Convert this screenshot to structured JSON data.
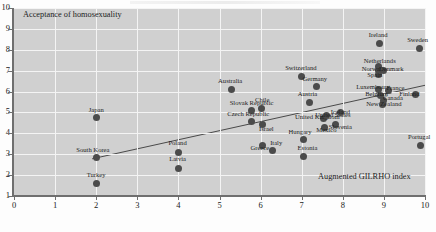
{
  "axes": {
    "y_title": "Acceptance of homosexuality",
    "x_title": "Augmented GILRHO index",
    "y_ticks": [
      "10",
      "9",
      "8",
      "7",
      "6",
      "5",
      "4",
      "3",
      "2",
      "1"
    ],
    "x_ticks": [
      "0",
      "1",
      "2",
      "3",
      "4",
      "5",
      "6",
      "7",
      "8",
      "9",
      "10"
    ]
  },
  "chart_data": {
    "type": "scatter",
    "title": "",
    "xlabel": "Augmented GILRHO index",
    "ylabel": "Acceptance of homosexuality",
    "xlim": [
      0,
      10
    ],
    "ylim": [
      1,
      10
    ],
    "grid": true,
    "legend": "none",
    "trendline": {
      "x": [
        1.9,
        10.0
      ],
      "y": [
        2.78,
        6.3
      ]
    },
    "points": [
      {
        "label": "Japan",
        "x": 2.0,
        "y": 4.75,
        "lx": 2.0,
        "ly": 5.12
      },
      {
        "label": "South Korea",
        "x": 2.0,
        "y": 2.82,
        "lx": 1.92,
        "ly": 3.22
      },
      {
        "label": "Turkey",
        "x": 2.0,
        "y": 1.58,
        "lx": 2.0,
        "ly": 2.0
      },
      {
        "label": "Poland",
        "x": 4.0,
        "y": 3.1,
        "lx": 3.98,
        "ly": 3.52
      },
      {
        "label": "Latvia",
        "x": 4.0,
        "y": 2.33,
        "lx": 3.98,
        "ly": 2.78
      },
      {
        "label": "Australia",
        "x": 5.28,
        "y": 6.1,
        "lx": 5.26,
        "ly": 6.5
      },
      {
        "label": "Slovak Republic",
        "x": 5.78,
        "y": 5.07,
        "lx": 5.78,
        "ly": 5.45
      },
      {
        "label": "Czech Republic",
        "x": 5.78,
        "y": 4.55,
        "lx": 5.7,
        "ly": 4.92
      },
      {
        "label": "Chile",
        "x": 6.02,
        "y": 5.18,
        "lx": 6.04,
        "ly": 5.58
      },
      {
        "label": "Israel",
        "x": 6.04,
        "y": 4.44,
        "lx": 6.14,
        "ly": 4.22
      },
      {
        "label": "Greece",
        "x": 6.04,
        "y": 3.42,
        "lx": 5.98,
        "ly": 3.3
      },
      {
        "label": "Italy",
        "x": 6.28,
        "y": 3.2,
        "lx": 6.38,
        "ly": 3.55
      },
      {
        "label": "Switzerland",
        "x": 7.0,
        "y": 6.72,
        "lx": 6.98,
        "ly": 7.12
      },
      {
        "label": "Germany",
        "x": 7.36,
        "y": 6.22,
        "lx": 7.32,
        "ly": 6.6
      },
      {
        "label": "Austria",
        "x": 7.2,
        "y": 5.5,
        "lx": 7.14,
        "ly": 5.88
      },
      {
        "label": "Hungary",
        "x": 7.04,
        "y": 3.72,
        "lx": 6.96,
        "ly": 4.05
      },
      {
        "label": "Estonia",
        "x": 7.04,
        "y": 2.9,
        "lx": 7.14,
        "ly": 3.28
      },
      {
        "label": "United Kingdom",
        "x": 7.52,
        "y": 4.72,
        "lx": 7.38,
        "ly": 4.78
      },
      {
        "label": "United States",
        "x": 7.6,
        "y": 4.86,
        "lx": 7.76,
        "ly": 4.88
      },
      {
        "label": "Mexico",
        "x": 7.56,
        "y": 4.28,
        "lx": 7.6,
        "ly": 4.18
      },
      {
        "label": "Slovenia",
        "x": 7.82,
        "y": 4.4,
        "lx": 7.94,
        "ly": 4.28
      },
      {
        "label": "Iceland",
        "x": 7.94,
        "y": 5.02,
        "lx": 7.94,
        "ly": 5.02
      },
      {
        "label": "Ireland",
        "x": 8.9,
        "y": 8.3,
        "lx": 8.86,
        "ly": 8.72
      },
      {
        "label": "Sweden",
        "x": 9.86,
        "y": 8.06,
        "lx": 9.82,
        "ly": 8.48
      },
      {
        "label": "Netherlands",
        "x": 8.88,
        "y": 7.18,
        "lx": 8.9,
        "ly": 7.48
      },
      {
        "label": "Norway",
        "x": 8.86,
        "y": 7.0,
        "lx": 8.72,
        "ly": 7.1
      },
      {
        "label": "Denmark",
        "x": 9.0,
        "y": 7.02,
        "lx": 9.18,
        "ly": 7.08
      },
      {
        "label": "Spain",
        "x": 8.86,
        "y": 6.8,
        "lx": 8.78,
        "ly": 6.8
      },
      {
        "label": "Luxembourg",
        "x": 8.88,
        "y": 6.1,
        "lx": 8.74,
        "ly": 6.22
      },
      {
        "label": "France",
        "x": 9.12,
        "y": 6.05,
        "lx": 9.28,
        "ly": 6.18
      },
      {
        "label": "Belgium",
        "x": 8.92,
        "y": 5.82,
        "lx": 8.82,
        "ly": 5.88
      },
      {
        "label": "Finland",
        "x": 9.78,
        "y": 5.86,
        "lx": 9.62,
        "ly": 5.9
      },
      {
        "label": "Canada",
        "x": 8.98,
        "y": 5.58,
        "lx": 9.22,
        "ly": 5.68
      },
      {
        "label": "New Zealand",
        "x": 8.96,
        "y": 5.4,
        "lx": 9.0,
        "ly": 5.4
      },
      {
        "label": "Portugal",
        "x": 9.9,
        "y": 3.42,
        "lx": 9.86,
        "ly": 3.82
      }
    ]
  }
}
